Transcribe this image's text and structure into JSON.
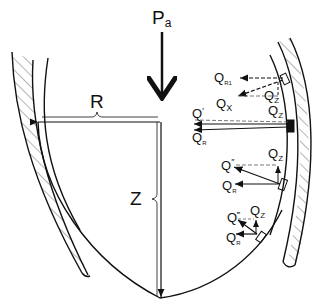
{
  "diagram": {
    "title_label": "Pa",
    "main_symbol": "P",
    "main_subscript": "a",
    "dimensions": {
      "radius": "R",
      "depth": "Z"
    },
    "force_labels": {
      "qr1": {
        "main": "Q",
        "sub": "R1"
      },
      "qx": {
        "main": "Q",
        "sub": "X"
      },
      "qz": {
        "main": "Q",
        "sub": "Z"
      },
      "q1": {
        "main": "Q",
        "prime": "′"
      },
      "q1z": {
        "main": "Q",
        "sub": "Z",
        "prime": "′"
      },
      "q1r": {
        "main": "Q",
        "sub": "R",
        "prime": "′"
      },
      "q2": {
        "main": "Q",
        "prime": "″"
      },
      "q2z": {
        "main": "Q",
        "sub": "Z",
        "prime": "″"
      },
      "q2r": {
        "main": "Q",
        "sub": "R",
        "prime": "″"
      },
      "q3": {
        "main": "Q",
        "prime": "‴"
      },
      "q3z": {
        "main": "Q",
        "sub": "Z",
        "prime": "‴"
      },
      "q3r": {
        "main": "Q",
        "sub": "R",
        "prime": "‴"
      }
    },
    "colors": {
      "ink": "#111111",
      "background": "#ffffff"
    }
  }
}
